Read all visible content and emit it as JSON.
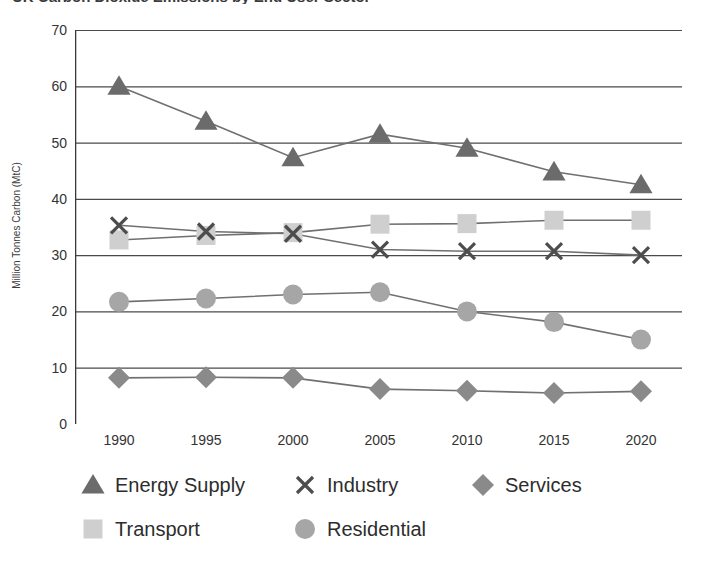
{
  "title": "UK Carbon Dioxide Emissions by End User Sector",
  "y_axis_title": "Million Tonnes Carbon (MtC)",
  "y_ticks": [
    "0",
    "10",
    "20",
    "30",
    "40",
    "50",
    "60",
    "70"
  ],
  "x_ticks": [
    "1990",
    "1995",
    "2000",
    "2005",
    "2010",
    "2015",
    "2020"
  ],
  "legend": {
    "row1": [
      {
        "label": "Energy Supply",
        "marker": "triangle-marker",
        "color": "#6b6b6b"
      },
      {
        "label": "Industry",
        "marker": "cross-marker",
        "color": "#4d4d4d"
      },
      {
        "label": "Services",
        "marker": "diamond-marker",
        "color": "#8a8a8a"
      }
    ],
    "row2": [
      {
        "label": "Transport",
        "marker": "square-marker",
        "color": "#cfcfcf"
      },
      {
        "label": "Residential",
        "marker": "circle-marker",
        "color": "#a6a6a6"
      }
    ]
  },
  "colors": {
    "energy_supply": "#6b6b6b",
    "industry": "#4d4d4d",
    "services": "#8a8a8a",
    "transport": "#cfcfcf",
    "residential": "#a6a6a6",
    "gridline": "#4a4a4a",
    "axis": "#3a3a3a"
  },
  "chart_data": {
    "type": "line",
    "title": "UK Carbon Dioxide Emissions by End User Sector",
    "xlabel": "",
    "ylabel": "Million Tonnes Carbon (MtC)",
    "x": [
      1990,
      1995,
      2000,
      2005,
      2010,
      2015,
      2020
    ],
    "categories": [
      "1990",
      "1995",
      "2000",
      "2005",
      "2010",
      "2015",
      "2020"
    ],
    "ylim": [
      0,
      70
    ],
    "ytick_step": 10,
    "grid": "horizontal",
    "legend_position": "bottom",
    "series": [
      {
        "name": "Energy Supply",
        "marker": "triangle",
        "color": "#6b6b6b",
        "values": [
          60.0,
          53.8,
          47.3,
          51.5,
          49.0,
          44.8,
          42.5
        ]
      },
      {
        "name": "Industry",
        "marker": "cross",
        "color": "#4d4d4d",
        "values": [
          35.3,
          34.2,
          33.8,
          31.0,
          30.7,
          30.7,
          30.0
        ]
      },
      {
        "name": "Services",
        "marker": "diamond",
        "color": "#8a8a8a",
        "values": [
          8.2,
          8.3,
          8.2,
          6.2,
          5.9,
          5.5,
          5.8
        ]
      },
      {
        "name": "Transport",
        "marker": "square",
        "color": "#cfcfcf",
        "values": [
          32.7,
          33.5,
          34.0,
          35.5,
          35.6,
          36.2,
          36.2
        ]
      },
      {
        "name": "Residential",
        "marker": "circle",
        "color": "#a6a6a6",
        "values": [
          21.7,
          22.3,
          23.0,
          23.4,
          20.0,
          18.1,
          15.0
        ]
      }
    ]
  }
}
